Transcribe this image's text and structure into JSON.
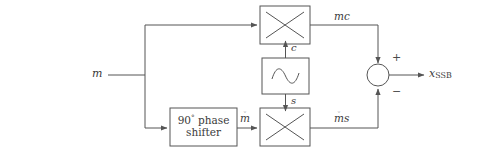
{
  "diagram": {
    "stroke_color": "#555555",
    "text_color": "#3a3a3a",
    "background": "#ffffff",
    "input": {
      "label": "m"
    },
    "output": {
      "base": "x",
      "subscript": "SSB"
    },
    "phase_shifter": {
      "line1_number": "90",
      "line1_degree": "°",
      "line1_word": "phase",
      "line2": "shifter"
    },
    "oscillator": {
      "symbol": "sine-wave"
    },
    "multiplier_top": {
      "symbol": "×",
      "output_label": "mc"
    },
    "multiplier_bottom": {
      "symbol": "×",
      "output_base": "m",
      "output_hat": "◦",
      "output_tail": "s"
    },
    "carrier_cos_label": "c",
    "carrier_sin_label": "s",
    "hilbert_label_base": "m",
    "hilbert_label_hat": "◦",
    "summer": {
      "plus": "+",
      "minus": "−"
    }
  }
}
